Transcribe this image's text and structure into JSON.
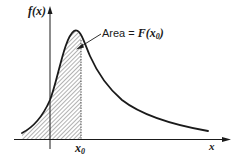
{
  "diagram": {
    "y_axis_label": "f(x)",
    "x_axis_label": "x",
    "marker_label": "x",
    "marker_subscript": "0",
    "annotation": {
      "prefix": "Area",
      "equals": "=",
      "function": "F(x",
      "subscript": "0",
      "suffix": ")"
    },
    "colors": {
      "stroke": "#1a1a1a",
      "hatch": "#555555",
      "background": "#ffffff"
    }
  }
}
